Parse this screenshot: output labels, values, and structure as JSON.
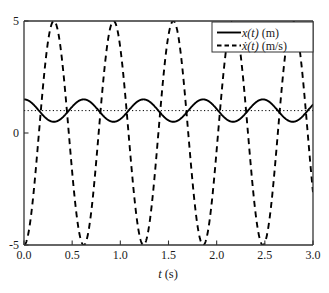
{
  "chart_data": {
    "type": "line",
    "title": "",
    "xlabel": "t (s)",
    "ylabel": "",
    "xlim": [
      0.0,
      3.0
    ],
    "ylim": [
      -5,
      5
    ],
    "grid": false,
    "xticks": [
      0.0,
      0.5,
      1.0,
      1.5,
      2.0,
      2.5,
      3.0
    ],
    "xtick_labels": [
      "0.0",
      "0.5",
      "1.0",
      "1.5",
      "2.0",
      "2.5",
      "3.0"
    ],
    "yticks": [
      5,
      0,
      -5
    ],
    "ytick_labels": [
      "5",
      "0",
      "-5"
    ],
    "legend_position": "upper right",
    "series": [
      {
        "name": "x(t) (m)",
        "legend_label_main": "x",
        "legend_label_arg": "(t)",
        "legend_label_unit": "(m)",
        "style": "solid",
        "color": "#000000",
        "linewidth": 1.8,
        "description": "position: steady mean 1.0 m with 0.5 m amplitude oscillation, period 0.62 s, starts at maximum 1.5 m",
        "mean": 1.0,
        "amplitude": 0.5,
        "period": 0.62,
        "phase_deg": 0,
        "t_start": 0.0,
        "x_start": 1.5
      },
      {
        "name": "xdot(t) (m/s)",
        "legend_label_main": "ẋ",
        "legend_label_arg": "(t)",
        "legend_label_unit": "(m/s)",
        "style": "dashed",
        "color": "#000000",
        "linewidth": 1.8,
        "description": "velocity: zero mean, 5 m/s amplitude, period 0.62 s, starts at 0 and goes negative first",
        "mean": 0.0,
        "amplitude": 5.0,
        "period": 0.62,
        "phase_deg": 180,
        "t_start": 0.0,
        "xdot_start": 0.0
      }
    ],
    "reference_lines": [
      {
        "name": "steady-state-mean",
        "orientation": "horizontal",
        "value": 1.0,
        "style": "dotted",
        "color": "#000000"
      }
    ],
    "annotations": []
  },
  "legend": {
    "entries": [
      {
        "label": "x(t) (m)",
        "style": "solid"
      },
      {
        "label": "ẋ(t) (m/s)",
        "style": "dashed"
      }
    ]
  },
  "axes": {
    "x_axis_title": "t (s)",
    "x_axis_title_var": "t",
    "x_axis_title_unit": "(s)"
  }
}
